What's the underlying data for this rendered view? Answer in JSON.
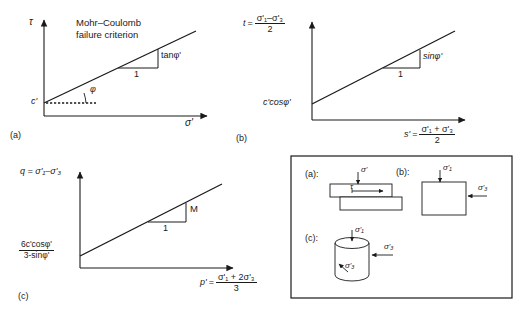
{
  "figure": {
    "type": "multi-panel line diagram"
  },
  "panels": [
    {
      "id": "a",
      "letter": "(a)",
      "y_axis_label": "τ",
      "x_axis_label": "σ'",
      "title_line1": "Mohr–Coulomb",
      "title_line2": "failure criterion",
      "intercept_label": "c'",
      "slope_rise_label": "tanφ'",
      "slope_run_label": "1",
      "angle_label": "φ",
      "angle_prime": "'",
      "has_dashed_reference": true
    },
    {
      "id": "b",
      "letter": "(b)",
      "y_axis_symbol": "t",
      "y_axis_equals": "=",
      "y_axis_numerator": "σ'₁–σ'₃",
      "y_axis_denominator": "2",
      "x_axis_symbol": "s'",
      "x_axis_equals": "=",
      "x_axis_numerator": "σ'₁ + σ'₃",
      "x_axis_denominator": "2",
      "intercept_label": "c'cosφ'",
      "slope_rise_label": "sinφ'",
      "slope_run_label": "1"
    },
    {
      "id": "c",
      "letter": "(c)",
      "y_axis_label": "q = σ'₁–σ'₃",
      "x_axis_symbol": "p'",
      "x_axis_equals": "=",
      "x_axis_numerator": "σ'₁ + 2σ'₃",
      "x_axis_denominator": "3",
      "intercept_numerator": "6c'cosφ'",
      "intercept_denominator": "3-sinφ'",
      "slope_rise_label": "M",
      "slope_run_label": "1"
    }
  ],
  "inset": {
    "items": [
      {
        "letter": "(a):",
        "shape": "direct-shear-box",
        "vertical_stress": "σ'",
        "shear_stress": "τ"
      },
      {
        "letter": "(b):",
        "shape": "plane-strain-square",
        "vertical_stress": "σ'₁",
        "lateral_stress": "σ'₃"
      },
      {
        "letter": "(c):",
        "shape": "triaxial-cylinder",
        "vertical_stress": "σ'₁",
        "lateral_stress": "σ'₃",
        "lateral_stress_2": "σ'₃"
      }
    ]
  },
  "style": {
    "line_color": "#1a1a1a",
    "background": "#ffffff"
  }
}
